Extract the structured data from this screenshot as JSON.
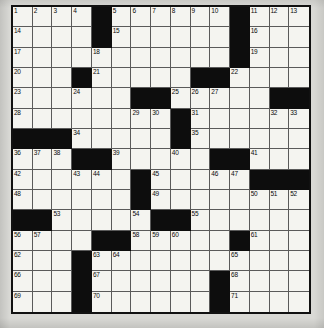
{
  "puzzle": {
    "type": "crossword-grid",
    "title": "Crossword Puzzle Grid",
    "columns": 15,
    "rows": 15,
    "colors": {
      "white_cell": "#f4f4f0",
      "black_cell": "#0d0d0d",
      "grid_line": "#5a5a5a",
      "border": "#111111",
      "page_background": "#d9d9d5",
      "number_text": "#0a0a0a"
    },
    "legend": {
      "black_symbol": "#",
      "empty_symbol": "."
    },
    "grid": [
      [
        "1",
        "2",
        "3",
        "4",
        "#",
        "5",
        "6",
        "7",
        "8",
        "9",
        "10",
        "#",
        "11",
        "12",
        "13"
      ],
      [
        "14",
        ".",
        ".",
        ".",
        "#",
        "15",
        ".",
        ".",
        ".",
        ".",
        ".",
        "#",
        "16",
        ".",
        "."
      ],
      [
        "17",
        ".",
        ".",
        ".",
        "18",
        ".",
        ".",
        ".",
        ".",
        ".",
        ".",
        "#",
        "19",
        ".",
        "."
      ],
      [
        "20",
        ".",
        ".",
        "#",
        "21",
        ".",
        ".",
        ".",
        ".",
        "#",
        "#",
        "22",
        ".",
        ".",
        "."
      ],
      [
        "23",
        ".",
        ".",
        "24",
        ".",
        ".",
        "#",
        "#",
        "25",
        "26",
        "27",
        ".",
        ".",
        "#",
        "#"
      ],
      [
        "28",
        ".",
        ".",
        ".",
        ".",
        ".",
        "29",
        "30",
        "#",
        "31",
        ".",
        ".",
        ".",
        "32",
        "33"
      ],
      [
        "#",
        "#",
        "#",
        "34",
        ".",
        ".",
        ".",
        ".",
        "#",
        "35",
        ".",
        ".",
        ".",
        ".",
        "."
      ],
      [
        "36",
        "37",
        "38",
        "#",
        "#",
        "39",
        ".",
        ".",
        "40",
        ".",
        "#",
        "#",
        "41",
        ".",
        "."
      ],
      [
        "42",
        ".",
        ".",
        "43",
        "44",
        ".",
        "#",
        "45",
        ".",
        ".",
        "46",
        "47",
        "#",
        "#",
        "#"
      ],
      [
        "48",
        ".",
        ".",
        ".",
        ".",
        ".",
        "#",
        "49",
        ".",
        ".",
        ".",
        ".",
        "50",
        "51",
        "52"
      ],
      [
        "#",
        "#",
        "53",
        ".",
        ".",
        ".",
        "54",
        "#",
        "#",
        "55",
        ".",
        ".",
        ".",
        ".",
        "."
      ],
      [
        "56",
        "57",
        ".",
        ".",
        "#",
        "#",
        "58",
        "59",
        "60",
        ".",
        ".",
        "#",
        "61",
        ".",
        "."
      ],
      [
        "62",
        ".",
        ".",
        "#",
        "63",
        "64",
        ".",
        ".",
        ".",
        ".",
        ".",
        "65",
        ".",
        ".",
        "."
      ],
      [
        "66",
        ".",
        ".",
        "#",
        "67",
        ".",
        ".",
        ".",
        ".",
        ".",
        "#",
        "68",
        ".",
        ".",
        "."
      ],
      [
        "69",
        ".",
        ".",
        "#",
        "70",
        ".",
        ".",
        ".",
        ".",
        ".",
        "#",
        "71",
        ".",
        ".",
        "."
      ]
    ],
    "clue_numbers": [
      "1",
      "2",
      "3",
      "4",
      "5",
      "6",
      "7",
      "8",
      "9",
      "10",
      "11",
      "12",
      "13",
      "14",
      "15",
      "16",
      "17",
      "18",
      "19",
      "20",
      "21",
      "22",
      "23",
      "24",
      "25",
      "26",
      "27",
      "28",
      "29",
      "30",
      "31",
      "32",
      "33",
      "34",
      "35",
      "36",
      "37",
      "38",
      "39",
      "40",
      "41",
      "42",
      "43",
      "44",
      "45",
      "46",
      "47",
      "48",
      "49",
      "50",
      "51",
      "52",
      "53",
      "54",
      "55",
      "56",
      "57",
      "58",
      "59",
      "60",
      "61",
      "62",
      "63",
      "64",
      "65",
      "66",
      "67",
      "68",
      "69",
      "70",
      "71"
    ]
  }
}
